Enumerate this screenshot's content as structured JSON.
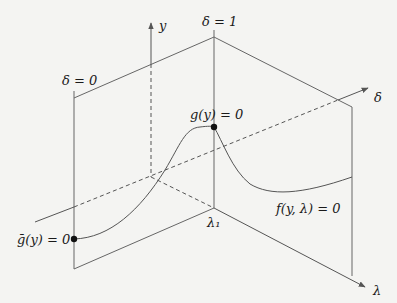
{
  "diagram": {
    "type": "3d-bifurcation-diagram",
    "axes": {
      "y": "y",
      "delta": "δ",
      "lambda": "λ"
    },
    "planes": {
      "left": "δ = 0",
      "right": "δ = 1"
    },
    "points": {
      "gbar": "ḡ(y) = 0",
      "g": "g(y) = 0"
    },
    "curve_label": "f(y, λ) = 0",
    "tick_label": "λ₁",
    "colors": {
      "line": "#555555",
      "background": "#f4f4f2",
      "point": "#111111"
    }
  }
}
